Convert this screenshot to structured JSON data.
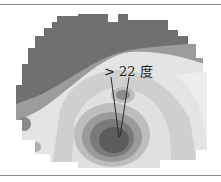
{
  "figure": {
    "annotation": "> 22 度",
    "type": "grayscale contour topography map",
    "colors": {
      "outer_dark": "#6f6f6f",
      "mid_gray": "#9a9a9a",
      "light": "#d8d8d8",
      "lightest": "#eeeeee",
      "center_dark": "#555555",
      "line": "#333333",
      "rule": "#8a8a8a"
    }
  }
}
